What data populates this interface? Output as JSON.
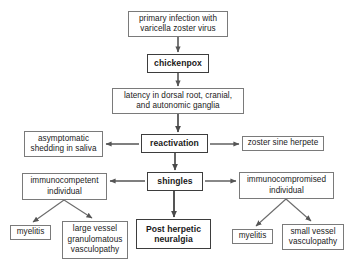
{
  "diagram": {
    "background_color": "#ffffff",
    "box_border_color": "#7a7a7a",
    "emphasis_border_color": "#3d3d3d",
    "arrow_color": "#555555",
    "text_color": "#1a1a1a",
    "nodes": [
      {
        "id": "primary-infection",
        "label": "primary infection with\nvaricella zoster virus",
        "emphasis": false,
        "x": 128,
        "y": 11,
        "w": 100,
        "h": 26
      },
      {
        "id": "chickenpox",
        "label": "chickenpox",
        "emphasis": true,
        "x": 147,
        "y": 54,
        "w": 62,
        "h": 19
      },
      {
        "id": "latency",
        "label": "latency in dorsal root, cranial,\nand autonomic ganglia",
        "emphasis": false,
        "x": 112,
        "y": 88,
        "w": 132,
        "h": 26
      },
      {
        "id": "asymptomatic-shedding",
        "label": "asymptomatic\nshedding in saliva",
        "emphasis": false,
        "x": 24,
        "y": 131,
        "w": 79,
        "h": 26
      },
      {
        "id": "reactivation",
        "label": "reactivation",
        "emphasis": true,
        "x": 141,
        "y": 134,
        "w": 67,
        "h": 19
      },
      {
        "id": "zoster-sine-herpete",
        "label": "zoster sine herpete",
        "emphasis": false,
        "x": 242,
        "y": 136,
        "w": 82,
        "h": 15
      },
      {
        "id": "immunocompetent",
        "label": "immunocompetent\nindividual",
        "emphasis": false,
        "x": 22,
        "y": 173,
        "w": 85,
        "h": 27
      },
      {
        "id": "shingles",
        "label": "shingles",
        "emphasis": true,
        "x": 147,
        "y": 172,
        "w": 56,
        "h": 19
      },
      {
        "id": "immunocompromised",
        "label": "immunocompromised\nindividual",
        "emphasis": false,
        "x": 239,
        "y": 172,
        "w": 95,
        "h": 27
      },
      {
        "id": "myelitis-left",
        "label": "myelitis",
        "emphasis": false,
        "x": 10,
        "y": 225,
        "w": 41,
        "h": 15
      },
      {
        "id": "large-vessel-vasculopathy",
        "label": "large vessel\ngranulomatous\nvasculopathy",
        "emphasis": false,
        "x": 62,
        "y": 221,
        "w": 66,
        "h": 38
      },
      {
        "id": "post-herpetic-neuralgia",
        "label": "Post herpetic\nneuralgia",
        "emphasis": true,
        "x": 136,
        "y": 219,
        "w": 75,
        "h": 30
      },
      {
        "id": "myelitis-right",
        "label": "myelitis",
        "emphasis": false,
        "x": 232,
        "y": 229,
        "w": 41,
        "h": 15
      },
      {
        "id": "small-vessel-vasculopathy",
        "label": "small vessel\nvasculopathy",
        "emphasis": false,
        "x": 282,
        "y": 224,
        "w": 62,
        "h": 26
      }
    ],
    "edges": [
      {
        "id": "primary-to-chickenpox",
        "from": "primary-infection",
        "to": "chickenpox",
        "direction": "down"
      },
      {
        "id": "chickenpox-to-latency",
        "from": "chickenpox",
        "to": "latency",
        "direction": "down"
      },
      {
        "id": "latency-to-reactivation",
        "from": "latency",
        "to": "reactivation",
        "direction": "down"
      },
      {
        "id": "reactivation-to-asymptomatic",
        "from": "reactivation",
        "to": "asymptomatic-shedding",
        "direction": "left"
      },
      {
        "id": "reactivation-to-zoster-sine-herpete",
        "from": "reactivation",
        "to": "zoster-sine-herpete",
        "direction": "right"
      },
      {
        "id": "reactivation-to-shingles",
        "from": "reactivation",
        "to": "shingles",
        "direction": "down"
      },
      {
        "id": "shingles-to-immunocompetent",
        "from": "shingles",
        "to": "immunocompetent",
        "direction": "left"
      },
      {
        "id": "shingles-to-immunocompromised",
        "from": "shingles",
        "to": "immunocompromised",
        "direction": "right"
      },
      {
        "id": "shingles-to-post-herpetic-neuralgia",
        "from": "shingles",
        "to": "post-herpetic-neuralgia",
        "direction": "down"
      },
      {
        "id": "immunocompetent-to-myelitis",
        "from": "immunocompetent",
        "to": "myelitis-left",
        "direction": "fork-left"
      },
      {
        "id": "immunocompetent-to-large-vessel",
        "from": "immunocompetent",
        "to": "large-vessel-vasculopathy",
        "direction": "fork-right"
      },
      {
        "id": "immunocompromised-to-myelitis",
        "from": "immunocompromised",
        "to": "myelitis-right",
        "direction": "fork-left"
      },
      {
        "id": "immunocompromised-to-small-vessel",
        "from": "immunocompromised",
        "to": "small-vessel-vasculopathy",
        "direction": "fork-right"
      }
    ]
  }
}
